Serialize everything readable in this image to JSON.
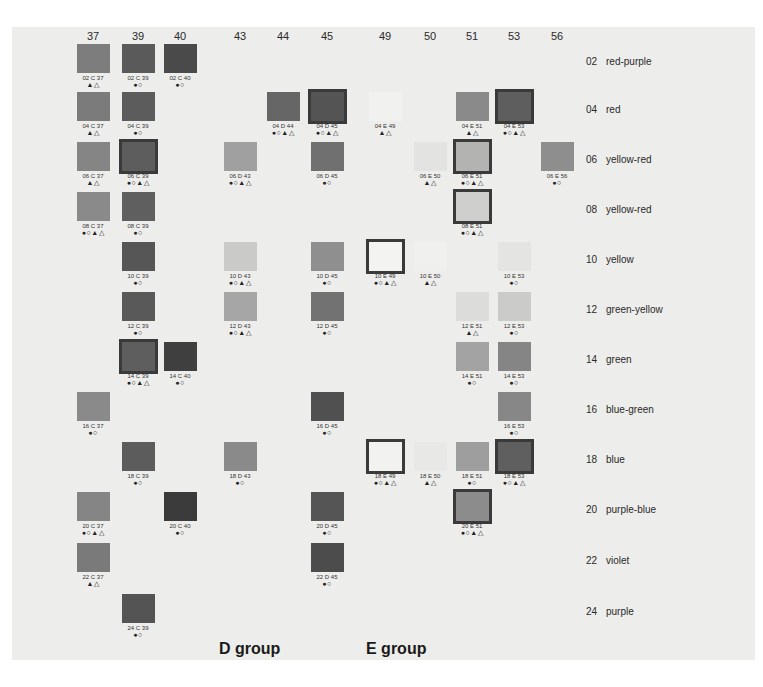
{
  "chart_data": {
    "type": "table",
    "title": "",
    "columns": [
      "37",
      "39",
      "40",
      "43",
      "44",
      "45",
      "49",
      "50",
      "51",
      "53",
      "56"
    ],
    "groups": [
      {
        "name": "D group",
        "columns": [
          "43",
          "44",
          "45"
        ]
      },
      {
        "name": "E group",
        "columns": [
          "49",
          "50",
          "51",
          "53",
          "56"
        ]
      }
    ],
    "rows": [
      {
        "code": "02",
        "hue": "red-purple"
      },
      {
        "code": "04",
        "hue": "red"
      },
      {
        "code": "06",
        "hue": "yellow-red"
      },
      {
        "code": "08",
        "hue": "yellow-red"
      },
      {
        "code": "10",
        "hue": "yellow"
      },
      {
        "code": "12",
        "hue": "green-yellow"
      },
      {
        "code": "14",
        "hue": "green"
      },
      {
        "code": "16",
        "hue": "blue-green"
      },
      {
        "code": "18",
        "hue": "blue"
      },
      {
        "code": "20",
        "hue": "purple-blue"
      },
      {
        "code": "22",
        "hue": "violet"
      },
      {
        "code": "24",
        "hue": "purple"
      }
    ],
    "symbol_legend": {
      "filled_circle": "●",
      "open_circle": "○",
      "filled_triangle": "▲",
      "open_triangle": "△"
    },
    "samples": [
      {
        "label": "02 C 37",
        "row": "02",
        "col": "37",
        "marks": "▲△",
        "framed": false,
        "color": "#7d7d7d"
      },
      {
        "label": "02 C 39",
        "row": "02",
        "col": "39",
        "marks": "●○",
        "framed": false,
        "color": "#5a5a5a"
      },
      {
        "label": "02 C 40",
        "row": "02",
        "col": "40",
        "marks": "●○",
        "framed": false,
        "color": "#4a4a4a"
      },
      {
        "label": "04 C 37",
        "row": "04",
        "col": "37",
        "marks": "▲△",
        "framed": false,
        "color": "#7b7b7b"
      },
      {
        "label": "04 C 39",
        "row": "04",
        "col": "39",
        "marks": "●○",
        "framed": false,
        "color": "#5c5c5c"
      },
      {
        "label": "04 D 44",
        "row": "04",
        "col": "44",
        "marks": "●○▲△",
        "framed": false,
        "color": "#666666"
      },
      {
        "label": "04 D 45",
        "row": "04",
        "col": "45",
        "marks": "●○▲△",
        "framed": true,
        "color": "#545454"
      },
      {
        "label": "04 E 49",
        "row": "04",
        "col": "49",
        "marks": "▲△",
        "framed": false,
        "color": "#f1f1ef"
      },
      {
        "label": "04 E 51",
        "row": "04",
        "col": "51",
        "marks": "▲△",
        "framed": false,
        "color": "#8a8a8a"
      },
      {
        "label": "04 E 53",
        "row": "04",
        "col": "53",
        "marks": "●○▲△",
        "framed": true,
        "color": "#5e5e5e"
      },
      {
        "label": "06 C 37",
        "row": "06",
        "col": "37",
        "marks": "▲△",
        "framed": false,
        "color": "#858585"
      },
      {
        "label": "06 C 39",
        "row": "06",
        "col": "39",
        "marks": "●○▲△",
        "framed": true,
        "color": "#5d5d5d"
      },
      {
        "label": "06 D 43",
        "row": "06",
        "col": "43",
        "marks": "●○▲△",
        "framed": false,
        "color": "#a0a0a0"
      },
      {
        "label": "06 D 45",
        "row": "06",
        "col": "45",
        "marks": "●○",
        "framed": false,
        "color": "#707070"
      },
      {
        "label": "06 E 50",
        "row": "06",
        "col": "50",
        "marks": "▲△",
        "framed": false,
        "color": "#e3e3e1"
      },
      {
        "label": "06 E 51",
        "row": "06",
        "col": "51",
        "marks": "●○▲△",
        "framed": true,
        "color": "#b3b3b1"
      },
      {
        "label": "06 E 56",
        "row": "06",
        "col": "56",
        "marks": "●○",
        "framed": false,
        "color": "#8e8e8e"
      },
      {
        "label": "08 C 37",
        "row": "08",
        "col": "37",
        "marks": "●○▲△",
        "framed": false,
        "color": "#8a8a8a"
      },
      {
        "label": "08 C 39",
        "row": "08",
        "col": "39",
        "marks": "●○",
        "framed": false,
        "color": "#5f5f5f"
      },
      {
        "label": "08 E 51",
        "row": "08",
        "col": "51",
        "marks": "●○▲△",
        "framed": true,
        "color": "#cfcfcd"
      },
      {
        "label": "10 C 39",
        "row": "10",
        "col": "39",
        "marks": "●○",
        "framed": false,
        "color": "#565656"
      },
      {
        "label": "10 D 43",
        "row": "10",
        "col": "43",
        "marks": "●○▲△",
        "framed": false,
        "color": "#cacac8"
      },
      {
        "label": "10 D 45",
        "row": "10",
        "col": "45",
        "marks": "●○",
        "framed": false,
        "color": "#8f8f8f"
      },
      {
        "label": "10 E 49",
        "row": "10",
        "col": "49",
        "marks": "●○▲△",
        "framed": true,
        "color": "#f3f3f1"
      },
      {
        "label": "10 E 50",
        "row": "10",
        "col": "50",
        "marks": "▲△",
        "framed": false,
        "color": "#f0f0ee"
      },
      {
        "label": "10 E 53",
        "row": "10",
        "col": "53",
        "marks": "●○",
        "framed": false,
        "color": "#e4e4e2"
      },
      {
        "label": "12 C 39",
        "row": "12",
        "col": "39",
        "marks": "●○",
        "framed": false,
        "color": "#595959"
      },
      {
        "label": "12 D 43",
        "row": "12",
        "col": "43",
        "marks": "●○▲△",
        "framed": false,
        "color": "#a6a6a6"
      },
      {
        "label": "12 D 45",
        "row": "12",
        "col": "45",
        "marks": "●○",
        "framed": false,
        "color": "#727272"
      },
      {
        "label": "12 E 51",
        "row": "12",
        "col": "51",
        "marks": "▲△",
        "framed": false,
        "color": "#dcdcda"
      },
      {
        "label": "12 E 53",
        "row": "12",
        "col": "53",
        "marks": "●○",
        "framed": false,
        "color": "#cbcbc9"
      },
      {
        "label": "14 C 39",
        "row": "14",
        "col": "39",
        "marks": "●○▲△",
        "framed": true,
        "color": "#5e5e5e"
      },
      {
        "label": "14 C 40",
        "row": "14",
        "col": "40",
        "marks": "●○",
        "framed": false,
        "color": "#3f3f3f"
      },
      {
        "label": "14 E 51",
        "row": "14",
        "col": "51",
        "marks": "●○",
        "framed": false,
        "color": "#a3a3a3"
      },
      {
        "label": "14 E 53",
        "row": "14",
        "col": "53",
        "marks": "●○",
        "framed": false,
        "color": "#858585"
      },
      {
        "label": "16 C 37",
        "row": "16",
        "col": "37",
        "marks": "●○",
        "framed": false,
        "color": "#8a8a8a"
      },
      {
        "label": "16 D 45",
        "row": "16",
        "col": "45",
        "marks": "●○",
        "framed": false,
        "color": "#505050"
      },
      {
        "label": "16 E 53",
        "row": "16",
        "col": "53",
        "marks": "●○",
        "framed": false,
        "color": "#878787"
      },
      {
        "label": "18 C 39",
        "row": "18",
        "col": "39",
        "marks": "●○",
        "framed": false,
        "color": "#5c5c5c"
      },
      {
        "label": "18 D 43",
        "row": "18",
        "col": "43",
        "marks": "●○",
        "framed": false,
        "color": "#8a8a8a"
      },
      {
        "label": "18 E 49",
        "row": "18",
        "col": "49",
        "marks": "●○▲△",
        "framed": true,
        "color": "#f2f2f0"
      },
      {
        "label": "18 E 50",
        "row": "18",
        "col": "50",
        "marks": "▲△",
        "framed": false,
        "color": "#e8e8e6"
      },
      {
        "label": "18 E 51",
        "row": "18",
        "col": "51",
        "marks": "●○",
        "framed": false,
        "color": "#9e9e9e"
      },
      {
        "label": "18 E 53",
        "row": "18",
        "col": "53",
        "marks": "●○▲△",
        "framed": true,
        "color": "#5f5f5f"
      },
      {
        "label": "20 C 37",
        "row": "20",
        "col": "37",
        "marks": "●○▲△",
        "framed": false,
        "color": "#858585"
      },
      {
        "label": "20 C 40",
        "row": "20",
        "col": "40",
        "marks": "●○",
        "framed": false,
        "color": "#3b3b3b"
      },
      {
        "label": "20 D 45",
        "row": "20",
        "col": "45",
        "marks": "●○",
        "framed": false,
        "color": "#555555"
      },
      {
        "label": "20 E 51",
        "row": "20",
        "col": "51",
        "marks": "●○▲△",
        "framed": true,
        "color": "#8c8c8c"
      },
      {
        "label": "22 C 37",
        "row": "22",
        "col": "37",
        "marks": "▲△",
        "framed": false,
        "color": "#7a7a7a"
      },
      {
        "label": "22 D 45",
        "row": "22",
        "col": "45",
        "marks": "●○",
        "framed": false,
        "color": "#4c4c4c"
      },
      {
        "label": "24 C 39",
        "row": "24",
        "col": "39",
        "marks": "●○",
        "framed": false,
        "color": "#545454"
      }
    ]
  },
  "group_labels": {
    "d": "D group",
    "e": "E group"
  }
}
